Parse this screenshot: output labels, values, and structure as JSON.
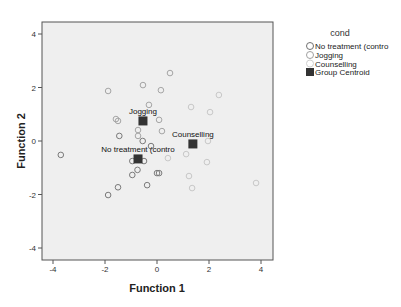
{
  "chart_data": {
    "type": "scatter",
    "title": "",
    "xlabel": "Function 1",
    "ylabel": "Function 2",
    "xlim": [
      -4.4,
      4.5
    ],
    "ylim": [
      -4.4,
      4.5
    ],
    "xticks": [
      -4,
      -2,
      0,
      2,
      4
    ],
    "yticks": [
      -4,
      -2,
      0,
      2,
      4
    ],
    "xtick_labels": [
      "-4",
      "-2",
      "0",
      "2",
      "4"
    ],
    "ytick_labels": [
      "-4",
      "-2",
      "0",
      "2",
      "4"
    ],
    "grid": false,
    "legend_position": "right",
    "legend_title": "cond",
    "legend": [
      {
        "label": "No treatment (contro",
        "marker": "open-circle",
        "color": "#707070"
      },
      {
        "label": "Jogging",
        "marker": "open-circle",
        "color": "#a0a0a0"
      },
      {
        "label": "Counselling",
        "marker": "open-circle",
        "color": "#c8c8c8"
      },
      {
        "label": "Group Centroid",
        "marker": "filled-square",
        "color": "#333333"
      }
    ],
    "series": [
      {
        "name": "No treatment (contro",
        "color": "#7a7a7a",
        "points": [
          [
            -3.7,
            -0.52
          ],
          [
            -0.5,
            -0.75
          ],
          [
            -0.95,
            -0.75
          ],
          [
            -0.75,
            -1.08
          ],
          [
            -0.95,
            -1.27
          ],
          [
            0.0,
            -1.2
          ],
          [
            0.08,
            -1.2
          ],
          [
            -0.38,
            -1.65
          ],
          [
            -1.5,
            -1.73
          ],
          [
            -1.88,
            -2.02
          ],
          [
            -0.23,
            -0.19
          ],
          [
            -0.55,
            0.0
          ],
          [
            -1.45,
            0.19
          ]
        ]
      },
      {
        "name": "Jogging",
        "color": "#a5a5a5",
        "points": [
          [
            0.5,
            2.54
          ],
          [
            -0.54,
            2.09
          ],
          [
            -1.88,
            1.87
          ],
          [
            0.15,
            1.9
          ],
          [
            -0.31,
            1.35
          ],
          [
            -1.58,
            0.82
          ],
          [
            -1.5,
            0.75
          ],
          [
            0.08,
            0.79
          ],
          [
            -0.73,
            0.41
          ],
          [
            0.19,
            0.37
          ],
          [
            -0.73,
            0.19
          ]
        ]
      },
      {
        "name": "Counselling",
        "color": "#c8c8c8",
        "points": [
          [
            2.38,
            1.72
          ],
          [
            1.31,
            1.27
          ],
          [
            2.04,
            1.08
          ],
          [
            1.96,
            -0.0
          ],
          [
            1.12,
            -0.49
          ],
          [
            1.92,
            -0.79
          ],
          [
            1.23,
            -1.31
          ],
          [
            1.35,
            -1.76
          ],
          [
            3.81,
            -1.57
          ],
          [
            0.42,
            -0.64
          ]
        ]
      }
    ],
    "centroids": [
      {
        "group": "Jogging",
        "x": -0.54,
        "y": 0.75,
        "label": "Jogging"
      },
      {
        "group": "No treatment (contro",
        "x": -0.73,
        "y": -0.67,
        "label": "No treatment (contro"
      },
      {
        "group": "Counselling",
        "x": 1.38,
        "y": -0.11,
        "label": "Counselling"
      }
    ]
  },
  "axes": {
    "x_title": "Function 1",
    "y_title": "Function 2"
  },
  "legend": {
    "title": "cond",
    "items": [
      {
        "label": "No treatment (contro"
      },
      {
        "label": "Jogging"
      },
      {
        "label": "Counselling"
      },
      {
        "label": "Group Centroid"
      }
    ]
  },
  "colors": {
    "plot_background": "#efefef",
    "frame": "#555555",
    "centroid": "#333333"
  }
}
